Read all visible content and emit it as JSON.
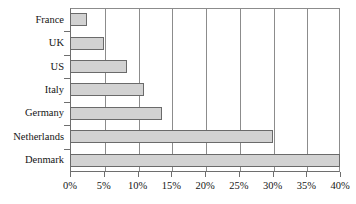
{
  "chart_data": {
    "type": "bar",
    "orientation": "horizontal",
    "title": "",
    "xlabel": "",
    "ylabel": "",
    "categories": [
      "France",
      "UK",
      "US",
      "Italy",
      "Germany",
      "Netherlands",
      "Denmark"
    ],
    "values": [
      2.5,
      5.0,
      8.5,
      11.0,
      13.7,
      30.0,
      40.0
    ],
    "value_suffix": "%",
    "xlim": [
      0,
      40
    ],
    "xticks": [
      0,
      5,
      10,
      15,
      20,
      25,
      30,
      35,
      40
    ],
    "xtick_labels": [
      "0%",
      "5%",
      "10%",
      "15%",
      "20%",
      "25%",
      "30%",
      "35%",
      "40%"
    ],
    "grid": "vertical",
    "legend": "none",
    "bar_fill_color": "#d2d2d2",
    "bar_border_color": "#6a6a6a",
    "axis_color": "#6e6e6e",
    "gridline_color": "#8c8c8c",
    "background_color": "#ffffff"
  }
}
